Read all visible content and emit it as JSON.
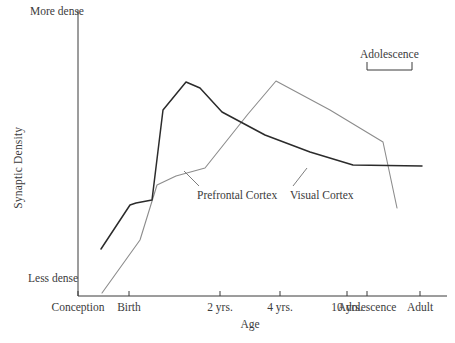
{
  "chart_data": {
    "type": "line",
    "title": "",
    "xlabel": "Age",
    "ylabel": "Synaptic Density",
    "ylim_labels": [
      "Less dense",
      "More dense"
    ],
    "grid": false,
    "legend": "inline-labels",
    "x_tick_labels": [
      "Conception",
      "Birth",
      "2 yrs.",
      "4 yrs.",
      "10 yrs.",
      "Adolescence",
      "Adult"
    ],
    "x_tick_positions_px": [
      78,
      129,
      220,
      280,
      347,
      367,
      420
    ],
    "annotations": [
      {
        "text": "Adolescence",
        "type": "bracket",
        "span_labels": [
          "Adolescence",
          "Adult"
        ],
        "span_px": [
          367,
          412
        ]
      }
    ],
    "series": [
      {
        "name": "Prefrontal Cortex",
        "color": "#2b2b2b",
        "label_x_px": 197,
        "label_y_px": 189,
        "points_px": [
          [
            101,
            249
          ],
          [
            130,
            205
          ],
          [
            136,
            203
          ],
          [
            152,
            200
          ],
          [
            163,
            110
          ],
          [
            186,
            82
          ],
          [
            200,
            88
          ],
          [
            222,
            112
          ],
          [
            265,
            135
          ],
          [
            310,
            152
          ],
          [
            353,
            165
          ],
          [
            422,
            166
          ]
        ]
      },
      {
        "name": "Visual Cortex",
        "color": "#8c8c8c",
        "label_x_px": 290,
        "label_y_px": 189,
        "points_px": [
          [
            102,
            293
          ],
          [
            140,
            240
          ],
          [
            157,
            185
          ],
          [
            176,
            176
          ],
          [
            205,
            168
          ],
          [
            248,
            114
          ],
          [
            276,
            81
          ],
          [
            330,
            110
          ],
          [
            383,
            142
          ],
          [
            397,
            208
          ]
        ]
      }
    ]
  },
  "axes": {
    "y_title": "Synaptic Density",
    "y_top_label": "More dense",
    "y_bottom_label": "Less dense",
    "x_title": "Age"
  },
  "ticks": [
    {
      "label": "Conception"
    },
    {
      "label": "Birth"
    },
    {
      "label": "2 yrs."
    },
    {
      "label": "4 yrs."
    },
    {
      "label": "10 yrs."
    },
    {
      "label": "Adolescence"
    },
    {
      "label": "Adult"
    }
  ],
  "series_labels": {
    "prefrontal": "Prefrontal Cortex",
    "visual": "Visual Cortex"
  },
  "bracket": {
    "label": "Adolescence"
  },
  "colors": {
    "prefrontal_line": "#2b2b2b",
    "visual_line": "#8c8c8c",
    "axis": "#3a3a3a",
    "background": "#ffffff"
  }
}
